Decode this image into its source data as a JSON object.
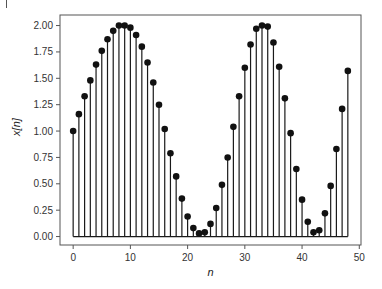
{
  "chart_data": {
    "type": "stem",
    "title": "",
    "xlabel": "n",
    "ylabel": "x[n]",
    "xlim": [
      -2.3,
      50.3
    ],
    "ylim": [
      -0.08,
      2.1
    ],
    "xticks": [
      0,
      10,
      20,
      30,
      40,
      50
    ],
    "xtick_labels": [
      "0",
      "10",
      "20",
      "30",
      "40",
      "50"
    ],
    "yticks": [
      0.0,
      0.25,
      0.5,
      0.75,
      1.0,
      1.25,
      1.5,
      1.75,
      2.0
    ],
    "ytick_labels": [
      "0.00",
      "0.25",
      "0.50",
      "0.75",
      "1.00",
      "1.25",
      "1.50",
      "1.75",
      "2.00"
    ],
    "grid": false,
    "legend": "none",
    "baseline": 0.0,
    "colors": {
      "stem": "#1a1a1a",
      "marker": "#111111",
      "frame": "#555555"
    },
    "x": [
      0,
      1,
      2,
      3,
      4,
      5,
      6,
      7,
      8,
      9,
      10,
      11,
      12,
      13,
      14,
      15,
      16,
      17,
      18,
      19,
      20,
      21,
      22,
      23,
      24,
      25,
      26,
      27,
      28,
      29,
      30,
      31,
      32,
      33,
      34,
      35,
      36,
      37,
      38,
      39,
      40,
      41,
      42,
      43,
      44,
      45,
      46,
      47,
      48
    ],
    "values": [
      1.0,
      1.16,
      1.33,
      1.48,
      1.63,
      1.76,
      1.87,
      1.95,
      2.0,
      2.0,
      1.98,
      1.91,
      1.8,
      1.65,
      1.46,
      1.25,
      1.02,
      0.79,
      0.57,
      0.36,
      0.19,
      0.08,
      0.03,
      0.04,
      0.12,
      0.27,
      0.49,
      0.75,
      1.04,
      1.33,
      1.6,
      1.82,
      1.97,
      2.0,
      1.99,
      1.84,
      1.61,
      1.31,
      0.98,
      0.64,
      0.35,
      0.14,
      0.04,
      0.06,
      0.22,
      0.48,
      0.83,
      1.21,
      1.57
    ]
  }
}
